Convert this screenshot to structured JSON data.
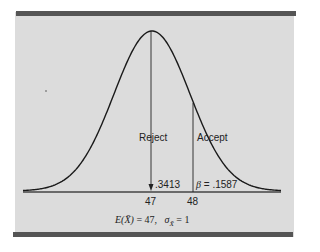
{
  "chart_data": {
    "type": "line",
    "title": "",
    "distribution": {
      "mean": 47,
      "sd": 1
    },
    "x_ticks": [
      "47",
      "48"
    ],
    "regions": [
      {
        "label": "Reject",
        "range": [
          47,
          48
        ],
        "area": ".3413"
      },
      {
        "label": "Accept",
        "range": [
          48,
          null
        ],
        "area": "β = .1587"
      }
    ],
    "annotations": {
      "left_area": ".3413",
      "right_area": "β = .1587",
      "formula": "E(X̄) = 47,  σX̄ = 1"
    },
    "xlabel": "",
    "ylabel": "",
    "grid": false,
    "legend": "none"
  },
  "labels": {
    "reject": "Reject",
    "accept": "Accept",
    "area_left": ".3413",
    "beta_symbol": "β",
    "area_right_eq": " = .1587",
    "tick_47": "47",
    "tick_48": "48",
    "formula_lhs": "E(X̄)",
    "formula_eq1": " = 47,",
    "formula_sigma": "σ",
    "formula_sub": "X̄",
    "formula_eq2": " = 1"
  },
  "colors": {
    "panel": "#dcdcdc",
    "rule": "#555555",
    "ink": "#222222"
  }
}
